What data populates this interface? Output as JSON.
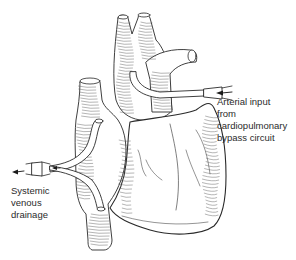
{
  "figure": {
    "ink_color": "#2a2a2a",
    "background_color": "#ffffff"
  },
  "labels": {
    "arterial": {
      "lines": [
        "Arterial input",
        "from",
        "cardiopulmonary",
        "bypass circuit"
      ],
      "arrow_direction": "left"
    },
    "venous": {
      "lines": [
        "Systemic",
        "venous",
        "drainage"
      ],
      "arrow_direction": "left"
    }
  }
}
